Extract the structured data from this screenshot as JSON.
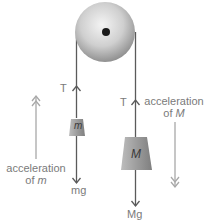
{
  "diagram": {
    "pulley": {
      "cx": 105,
      "cy": 32,
      "r": 30
    },
    "masses": {
      "small": {
        "symbol": "m",
        "weight_label": "mg",
        "tension_label": "T"
      },
      "large": {
        "symbol": "M",
        "weight_label": "Mg",
        "tension_label": "T"
      }
    },
    "accelerations": {
      "small": {
        "line1": "acceleration",
        "line2_prefix": "of ",
        "line2_symbol": "m",
        "direction": "up"
      },
      "large": {
        "line1": "acceleration",
        "line2_prefix": "of ",
        "line2_symbol": "M",
        "direction": "down"
      }
    },
    "colors": {
      "rope": "#5a5a5a",
      "label": "#7a7a7a",
      "accel_arrow": "#a8a8a8",
      "pulley_light": "#f2f2f2",
      "pulley_dark": "#8c8c8c",
      "axle": "#1a1a1a",
      "mass_fill": "#9a9a9a"
    }
  }
}
